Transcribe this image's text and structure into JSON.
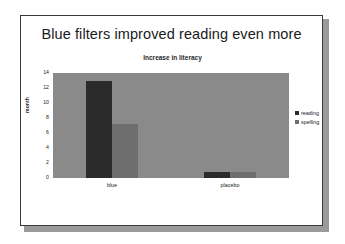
{
  "slide": {
    "title": "Blue filters improved reading even more"
  },
  "chart_data": {
    "type": "bar",
    "title": "Increase in literacy",
    "xlabel": "",
    "ylabel": "month",
    "categories": [
      "blue",
      "placebo"
    ],
    "series": [
      {
        "name": "reading",
        "values": [
          13,
          0.8
        ],
        "color": "#2b2b2b"
      },
      {
        "name": "spelling",
        "values": [
          7.2,
          0.8
        ],
        "color": "#6e6e6e"
      }
    ],
    "ylim": [
      0,
      14
    ],
    "yticks": [
      "0",
      "2",
      "4",
      "6",
      "8",
      "10",
      "12",
      "14"
    ],
    "grid": false,
    "legend_position": "right",
    "plot_background": "#8a8a8a"
  }
}
